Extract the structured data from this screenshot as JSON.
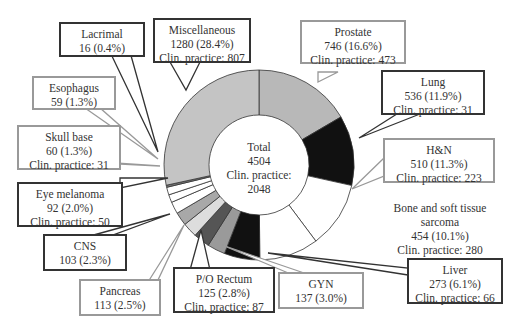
{
  "chart_data": {
    "type": "pie",
    "subtype": "donut",
    "title": "",
    "center_label": {
      "line1": "Total",
      "line2": "4504",
      "line3": "Clin. practice:",
      "line4": "2048"
    },
    "total": 4504,
    "total_clinical_practice": 2048,
    "slices": [
      {
        "name": "Prostate",
        "value": 746,
        "percent": 16.6,
        "clinical_practice": 473,
        "color": "#b8b8b8"
      },
      {
        "name": "Lung",
        "value": 536,
        "percent": 11.9,
        "clinical_practice": 31,
        "color": "#111111"
      },
      {
        "name": "H&N",
        "value": 510,
        "percent": 11.3,
        "clinical_practice": 223,
        "color": "#ffffff"
      },
      {
        "name": "Bone and soft tissue sarcoma",
        "value": 454,
        "percent": 10.1,
        "clinical_practice": 280,
        "color": "#ffffff"
      },
      {
        "name": "Liver",
        "value": 273,
        "percent": 6.1,
        "clinical_practice": 66,
        "color": "#111111"
      },
      {
        "name": "GYN",
        "value": 137,
        "percent": 3.0,
        "clinical_practice": null,
        "color": "#9a9a9a"
      },
      {
        "name": "P/O Rectum",
        "value": 125,
        "percent": 2.8,
        "clinical_practice": 87,
        "color": "#555555"
      },
      {
        "name": "Pancreas",
        "value": 113,
        "percent": 2.5,
        "clinical_practice": null,
        "color": "#dddddd"
      },
      {
        "name": "CNS",
        "value": 103,
        "percent": 2.3,
        "clinical_practice": null,
        "color": "#a8a8a8"
      },
      {
        "name": "Eye melanoma",
        "value": 92,
        "percent": 2.0,
        "clinical_practice": 50,
        "color": "#ffffff"
      },
      {
        "name": "Skull base",
        "value": 60,
        "percent": 1.3,
        "clinical_practice": 31,
        "color": "#ffffff"
      },
      {
        "name": "Esophagus",
        "value": 59,
        "percent": 1.3,
        "clinical_practice": null,
        "color": "#ffffff"
      },
      {
        "name": "Lacrimal",
        "value": 16,
        "percent": 0.4,
        "clinical_practice": null,
        "color": "#777777"
      },
      {
        "name": "Miscellaneous",
        "value": 1280,
        "percent": 28.4,
        "clinical_practice": 807,
        "color": "#c4c4c4"
      }
    ],
    "legend": "callout boxes"
  },
  "labels": {
    "lacrimal": {
      "name": "Lacrimal",
      "value": "16 (0.4%)"
    },
    "misc": {
      "name": "Miscellaneous",
      "value": "1280 (28.4%)",
      "cp": "Clin. practice: 807"
    },
    "prostate": {
      "name": "Prostate",
      "value": "746 (16.6%)",
      "cp": "Clin. practice: 473"
    },
    "lung": {
      "name": "Lung",
      "value": "536 (11.9%)",
      "cp": "Clin. practice: 31"
    },
    "hn": {
      "name": "H&N",
      "value": "510 (11.3%)",
      "cp": "Clin. practice: 223"
    },
    "bone": {
      "name1": "Bone and soft tissue",
      "name2": "sarcoma",
      "value": "454 (10.1%)",
      "cp": "Clin. practice: 280"
    },
    "liver": {
      "name": "Liver",
      "value": "273 (6.1%)",
      "cp": "Clin. practice: 66"
    },
    "gyn": {
      "name": "GYN",
      "value": "137 (3.0%)"
    },
    "rectum": {
      "name": "P/O Rectum",
      "value": "125 (2.8%)",
      "cp": "Clin. practice: 87"
    },
    "pancreas": {
      "name": "Pancreas",
      "value": "113 (2.5%)"
    },
    "cns": {
      "name": "CNS",
      "value": "103 (2.3%)"
    },
    "eye": {
      "name": "Eye melanoma",
      "value": "92 (2.0%)",
      "cp": "Clin. practice: 50"
    },
    "skull": {
      "name": "Skull base",
      "value": "60 (1.3%)",
      "cp": "Clin. practice: 31"
    },
    "esophagus": {
      "name": "Esophagus",
      "value": "59 (1.3%)"
    }
  }
}
